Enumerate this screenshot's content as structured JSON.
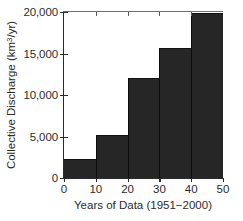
{
  "chart_data": {
    "type": "bar",
    "title": "",
    "xlabel": "Years of Data (1951−2000)",
    "ylabel_prefix": "Collective Discharge (km",
    "ylabel_exponent": "3",
    "ylabel_suffix": "/yr)",
    "ylabel_full": "Collective Discharge (km3/yr)",
    "categories": [
      "0–10",
      "10–20",
      "20–30",
      "30–40",
      "40–50"
    ],
    "bin_edges": [
      0,
      10,
      20,
      30,
      40,
      50
    ],
    "values": [
      2300,
      5200,
      12000,
      15700,
      19900
    ],
    "xlim": [
      0,
      50
    ],
    "ylim": [
      0,
      20000
    ],
    "xticks": [
      0,
      10,
      20,
      30,
      40,
      50
    ],
    "xtick_labels": [
      "0",
      "10",
      "20",
      "30",
      "40",
      "50"
    ],
    "yticks": [
      0,
      5000,
      10000,
      15000,
      20000
    ],
    "ytick_labels": [
      "0",
      "5,000",
      "10,000",
      "15,000",
      "20,000"
    ],
    "grid": false,
    "legend": null,
    "bar_color": "#262626",
    "axis_color": "#2b2b2b",
    "background_color": "#ffffff"
  }
}
